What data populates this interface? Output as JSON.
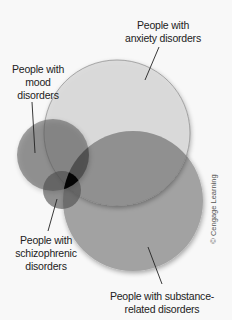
{
  "diagram": {
    "type": "venn",
    "title": "",
    "sets": [
      {
        "id": "anxiety",
        "label_lines": [
          "People with",
          "anxiety disorders"
        ],
        "cx": 117,
        "cy": 133,
        "r": 73,
        "fill": "#dcdcdc"
      },
      {
        "id": "substance",
        "label_lines": [
          "People with substance-",
          "related disorders"
        ],
        "cx": 133,
        "cy": 201,
        "r": 70,
        "fill": "#9e9e9e"
      },
      {
        "id": "mood",
        "label_lines": [
          "People with",
          "mood",
          "disorders"
        ],
        "cx": 53,
        "cy": 155,
        "r": 36,
        "fill": "#6e6e6e"
      },
      {
        "id": "schizophrenic",
        "label_lines": [
          "People with",
          "schizophrenic",
          "disorders"
        ],
        "cx": 62,
        "cy": 190,
        "r": 19,
        "fill": "#555555"
      }
    ],
    "intersection_all_color": "#000000"
  },
  "labels": {
    "anxiety": {
      "line1": "People with",
      "line2": "anxiety disorders"
    },
    "mood": {
      "line1": "People with",
      "line2": "mood",
      "line3": "disorders"
    },
    "schizophrenic": {
      "line1": "People with",
      "line2": "schizophrenic",
      "line3": "disorders"
    },
    "substance": {
      "line1": "People with substance-",
      "line2": "related disorders"
    }
  },
  "copyright": "© Cengage Learning"
}
